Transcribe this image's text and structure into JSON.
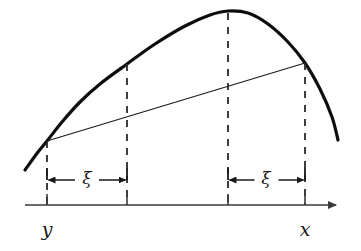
{
  "figure": {
    "title_text": "",
    "colors": {
      "curve": "#0d0d0d",
      "chord": "#1a1a1a",
      "dashed": "#2b2b2b",
      "axis": "#3a3a3a",
      "text": "#1a1a1a",
      "background": "#ffffff"
    }
  },
  "chart_data": {
    "type": "line",
    "title": "",
    "xlabel": "",
    "ylabel": "",
    "grid": false,
    "legend": null,
    "axis": {
      "start_x": 25,
      "end_x": 336,
      "y": 205,
      "has_arrow_head": true,
      "tick_height": 11
    },
    "tick_labels": [
      "y",
      "",
      "",
      "x"
    ],
    "tick_positions": [
      47,
      127,
      228,
      305
    ],
    "series": [
      {
        "name": "curve",
        "role": "concave-function",
        "stroke_width": 3.2,
        "points": [
          [
            25,
            170
          ],
          [
            38,
            152
          ],
          [
            47,
            141
          ],
          [
            62,
            122
          ],
          [
            80,
            102
          ],
          [
            100,
            84
          ],
          [
            127,
            64
          ],
          [
            155,
            44
          ],
          [
            185,
            26
          ],
          [
            210,
            15
          ],
          [
            228,
            11
          ],
          [
            248,
            13
          ],
          [
            268,
            24
          ],
          [
            288,
            42
          ],
          [
            305,
            63
          ],
          [
            320,
            89
          ],
          [
            332,
            117
          ],
          [
            338,
            140
          ]
        ]
      },
      {
        "name": "chord",
        "role": "secant-line",
        "stroke_width": 1.2,
        "points": [
          [
            47,
            141
          ],
          [
            305,
            63
          ]
        ]
      }
    ],
    "dashed_verticals": [
      {
        "name": "dashed-line-y",
        "x": 47,
        "y_top": 141,
        "y_bottom": 205
      },
      {
        "name": "dashed-line-y-plus-xi",
        "x": 127,
        "y_top": 64,
        "y_bottom": 205
      },
      {
        "name": "dashed-line-x-minus-xi",
        "x": 228,
        "y_top": 13,
        "y_bottom": 205
      },
      {
        "name": "dashed-line-x",
        "x": 305,
        "y_top": 63,
        "y_bottom": 205
      }
    ],
    "interval_markers": [
      {
        "name": "xi-interval-left",
        "label": "ξ",
        "from_x": 47,
        "to_x": 127,
        "baseline_y": 180,
        "stub_top_y": 168,
        "label_x": 87,
        "label_y": 184
      },
      {
        "name": "xi-interval-right",
        "label": "ξ",
        "from_x": 228,
        "to_x": 305,
        "baseline_y": 180,
        "stub_top_y": 168,
        "label_x": 266,
        "label_y": 184
      }
    ],
    "annotations": [
      {
        "name": "label-y",
        "text": "y",
        "x": 47,
        "y": 236
      },
      {
        "name": "label-x",
        "text": "x",
        "x": 305,
        "y": 236
      },
      {
        "name": "label-xi-left",
        "text": "ξ",
        "x": 87,
        "y": 184
      },
      {
        "name": "label-xi-right",
        "text": "ξ",
        "x": 266,
        "y": 184
      }
    ]
  }
}
